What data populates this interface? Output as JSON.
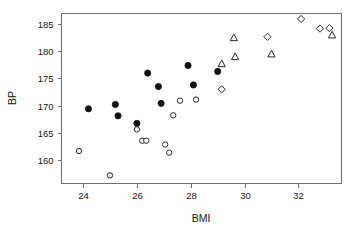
{
  "chart_data": {
    "type": "scatter",
    "title": "",
    "xlabel": "BMI",
    "ylabel": "BP",
    "xlim": [
      23.2,
      33.6
    ],
    "ylim": [
      155.6,
      187.0
    ],
    "xticks": [
      24,
      26,
      28,
      30,
      32
    ],
    "xtick_labels": [
      "24",
      "26",
      "28",
      "30",
      "32"
    ],
    "yticks": [
      160,
      165,
      170,
      175,
      180,
      185
    ],
    "ytick_labels": [
      "160",
      "165",
      "170",
      "175",
      "180",
      "185"
    ],
    "grid": false,
    "legend": "none",
    "frame": "box",
    "marker_colors": {
      "filled_circle": "#101010",
      "open_circle": "#2a2a2a",
      "triangle": "#2a2a2a",
      "diamond": "#2a2a2a",
      "axis": "#6e6e6e",
      "text": "#161616"
    },
    "series": [
      {
        "name": "filled-circle",
        "marker": "filled-circle",
        "points": [
          {
            "x": 24.2,
            "y": 169.4
          },
          {
            "x": 25.2,
            "y": 170.2
          },
          {
            "x": 25.3,
            "y": 168.1
          },
          {
            "x": 26.0,
            "y": 166.7
          },
          {
            "x": 26.4,
            "y": 176.0
          },
          {
            "x": 26.8,
            "y": 173.5
          },
          {
            "x": 26.9,
            "y": 170.4
          },
          {
            "x": 27.9,
            "y": 177.4
          },
          {
            "x": 28.1,
            "y": 173.8
          },
          {
            "x": 29.0,
            "y": 176.3
          }
        ]
      },
      {
        "name": "open-circle",
        "marker": "open-circle",
        "points": [
          {
            "x": 23.85,
            "y": 161.6
          },
          {
            "x": 25.0,
            "y": 157.1
          },
          {
            "x": 26.0,
            "y": 165.6
          },
          {
            "x": 26.2,
            "y": 163.5
          },
          {
            "x": 26.35,
            "y": 163.5
          },
          {
            "x": 27.05,
            "y": 162.8
          },
          {
            "x": 27.2,
            "y": 161.3
          },
          {
            "x": 27.35,
            "y": 168.2
          },
          {
            "x": 27.6,
            "y": 170.9
          },
          {
            "x": 28.2,
            "y": 171.1
          }
        ]
      },
      {
        "name": "triangle",
        "marker": "triangle",
        "points": [
          {
            "x": 29.15,
            "y": 177.7
          },
          {
            "x": 29.6,
            "y": 182.5
          },
          {
            "x": 29.65,
            "y": 179.0
          },
          {
            "x": 31.0,
            "y": 179.5
          },
          {
            "x": 33.25,
            "y": 183.0
          }
        ]
      },
      {
        "name": "diamond",
        "marker": "diamond",
        "points": [
          {
            "x": 29.15,
            "y": 173.0
          },
          {
            "x": 30.85,
            "y": 182.7
          },
          {
            "x": 32.1,
            "y": 186.0
          },
          {
            "x": 32.8,
            "y": 184.2
          },
          {
            "x": 33.15,
            "y": 184.3
          }
        ]
      }
    ]
  }
}
